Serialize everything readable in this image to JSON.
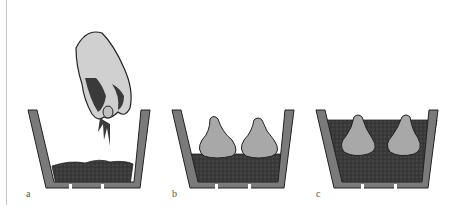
{
  "figure": {
    "panels": [
      {
        "label": "a",
        "description": "hand sprinkling compost into pot"
      },
      {
        "label": "b",
        "description": "two bulbs set on compost layer"
      },
      {
        "label": "c",
        "description": "bulbs covered with compost, tips showing"
      }
    ],
    "colors": {
      "pot": "#7a7a7a",
      "pot_outline": "#222222",
      "soil": "#3a3a3a",
      "bulb": "#a8a8a8",
      "hand": "#d0d0d0"
    }
  }
}
